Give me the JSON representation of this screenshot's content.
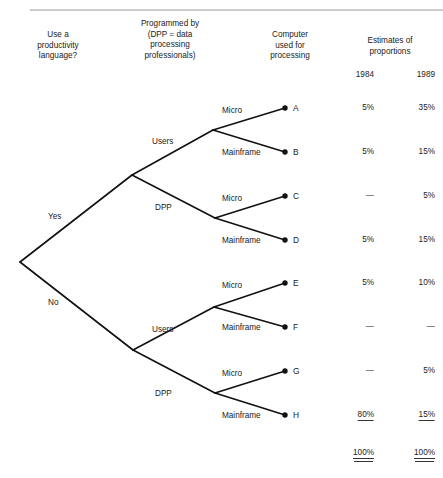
{
  "diagram": {
    "title_columns": [
      {
        "id": "col-question",
        "text": "Use a\nproductivity\nlanguage?",
        "cx": 58,
        "top": 30
      },
      {
        "id": "col-programmed-by",
        "text": "Programmed by\n(DPP = data\nprocessing\nprofessionals)",
        "cx": 170,
        "top": 19
      },
      {
        "id": "col-computer-used",
        "text": "Computer\nused for\nprocessing",
        "cx": 290,
        "top": 30
      },
      {
        "id": "col-estimates",
        "text": "Estimates of\nproportions",
        "cx": 390,
        "top": 36
      }
    ],
    "year_headers": [
      {
        "id": "year-1984",
        "label": "1984",
        "x": 374
      },
      {
        "id": "year-1989",
        "label": "1989",
        "x": 435
      }
    ],
    "top_rule": {
      "x1": 30,
      "x2": 443,
      "y": 10
    },
    "root": {
      "x": 20,
      "y": 262
    },
    "branches": [
      {
        "id": "yes",
        "label": "Yes",
        "node_x": 132,
        "node_y": 175,
        "label_x": 48,
        "label_y": 212
      },
      {
        "id": "no",
        "label": "No",
        "node_x": 133,
        "node_y": 350,
        "label_x": 48,
        "label_y": 298
      }
    ],
    "subnodes": [
      {
        "id": "yes-users",
        "label": "Users",
        "parent": "yes",
        "x": 213,
        "y": 130,
        "label_x": 152,
        "label_y": 137
      },
      {
        "id": "yes-dpp",
        "label": "DPP",
        "parent": "yes",
        "x": 215,
        "y": 218,
        "label_x": 155,
        "label_y": 203
      },
      {
        "id": "no-users",
        "label": "Users",
        "parent": "no",
        "x": 214,
        "y": 307,
        "label_x": 152,
        "label_y": 325
      },
      {
        "id": "no-dpp",
        "label": "DPP",
        "parent": "no",
        "x": 215,
        "y": 393,
        "label_x": 155,
        "label_y": 389
      }
    ],
    "terminals": [
      {
        "id": "A",
        "label": "A",
        "edge": "Micro",
        "parent": "yes-users",
        "dot_x": 285,
        "dot_y": 108,
        "edge_x": 222,
        "edge_y": 106,
        "y1984": "5%",
        "y1989": "35%"
      },
      {
        "id": "B",
        "label": "B",
        "edge": "Mainframe",
        "parent": "yes-users",
        "dot_x": 285,
        "dot_y": 152,
        "edge_x": 222,
        "edge_y": 148,
        "y1984": "5%",
        "y1989": "15%"
      },
      {
        "id": "C",
        "label": "C",
        "edge": "Micro",
        "parent": "yes-dpp",
        "dot_x": 285,
        "dot_y": 196,
        "edge_x": 222,
        "edge_y": 194,
        "y1984": "—",
        "y1989": "5%"
      },
      {
        "id": "D",
        "label": "D",
        "edge": "Mainframe",
        "parent": "yes-dpp",
        "dot_x": 285,
        "dot_y": 240,
        "edge_x": 222,
        "edge_y": 236,
        "y1984": "5%",
        "y1989": "15%"
      },
      {
        "id": "E",
        "label": "E",
        "edge": "Micro",
        "parent": "no-users",
        "dot_x": 285,
        "dot_y": 283,
        "edge_x": 222,
        "edge_y": 281,
        "y1984": "5%",
        "y1989": "10%"
      },
      {
        "id": "F",
        "label": "F",
        "edge": "Mainframe",
        "parent": "no-users",
        "dot_x": 285,
        "dot_y": 327,
        "edge_x": 222,
        "edge_y": 323,
        "y1984": "—",
        "y1989": "—"
      },
      {
        "id": "G",
        "label": "G",
        "edge": "Micro",
        "parent": "no-dpp",
        "dot_x": 285,
        "dot_y": 371,
        "edge_x": 222,
        "edge_y": 369,
        "y1984": "—",
        "y1989": "5%"
      },
      {
        "id": "H",
        "label": "H",
        "edge": "Mainframe",
        "parent": "no-dpp",
        "dot_x": 285,
        "dot_y": 415,
        "edge_x": 222,
        "edge_y": 411,
        "y1984": "80%",
        "y1989": "15%"
      }
    ],
    "column_x": {
      "y1984": 374,
      "y1989": 435
    },
    "totals": {
      "y1984": "100%",
      "y1989": "100%",
      "y": 448
    },
    "colors": {
      "line": "#111111",
      "text": "#222222",
      "rule": "#9a9a9a"
    }
  }
}
